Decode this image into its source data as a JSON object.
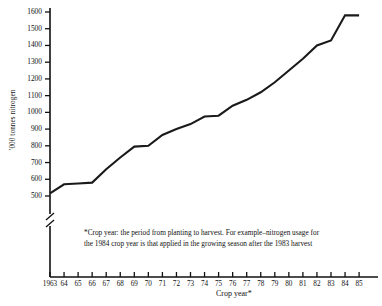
{
  "chart_data": {
    "type": "line",
    "title": "",
    "xlabel": "Crop year*",
    "ylabel": "'000 tonnes nitrogen",
    "ylim": [
      500,
      1600
    ],
    "ytick_step": 100,
    "yticks": [
      500,
      600,
      700,
      800,
      900,
      1000,
      1100,
      1200,
      1300,
      1400,
      1500,
      1600
    ],
    "ytick_labels": [
      "500",
      "600",
      "700",
      "800",
      "900",
      "1000",
      "1100",
      "1200",
      "1300",
      "1400",
      "1500",
      "1600"
    ],
    "axis_break": true,
    "axis_break_note": "y-axis broken below 500",
    "grid": false,
    "legend": "none",
    "x": [
      1963,
      1964,
      1965,
      1966,
      1967,
      1968,
      1969,
      1970,
      1971,
      1972,
      1973,
      1974,
      1975,
      1976,
      1977,
      1978,
      1979,
      1980,
      1981,
      1982,
      1983,
      1984,
      1985
    ],
    "xtick_labels": [
      "1963",
      "64",
      "65",
      "66",
      "67",
      "68",
      "69",
      "70",
      "71",
      "72",
      "73",
      "74",
      "75",
      "76",
      "77",
      "78",
      "79",
      "80",
      "81",
      "82",
      "83",
      "84",
      "85"
    ],
    "categories": [
      "1963",
      "64",
      "65",
      "66",
      "67",
      "68",
      "69",
      "70",
      "71",
      "72",
      "73",
      "74",
      "75",
      "76",
      "77",
      "78",
      "79",
      "80",
      "81",
      "82",
      "83",
      "84",
      "85"
    ],
    "series": [
      {
        "name": "Nitrogen usage",
        "values": [
          515,
          570,
          575,
          580,
          660,
          730,
          795,
          800,
          865,
          900,
          930,
          975,
          980,
          1040,
          1075,
          1120,
          1180,
          1250,
          1320,
          1400,
          1430,
          1580,
          1580
        ]
      }
    ],
    "values": [
      515,
      570,
      575,
      580,
      660,
      730,
      795,
      800,
      865,
      900,
      930,
      975,
      980,
      1040,
      1075,
      1120,
      1180,
      1250,
      1320,
      1400,
      1430,
      1580,
      1580
    ],
    "line_color": "#1a1a1a"
  },
  "footnote": {
    "line1": "*Crop year: the period from planting to harvest. For example–nitrogen usage for",
    "line2": "the 1984 crop year is that applied in the growing season after the 1983 harvest"
  }
}
